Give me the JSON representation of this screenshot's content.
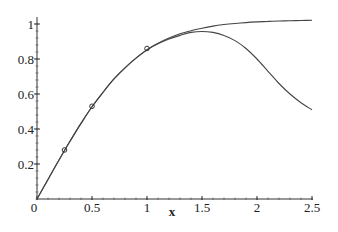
{
  "chart_data": {
    "type": "line",
    "title": "",
    "xlabel": "x",
    "ylabel": "",
    "xlim": [
      0,
      2.5
    ],
    "ylim": [
      0,
      1
    ],
    "grid": false,
    "legend": null,
    "x_ticks": [
      {
        "value": 0,
        "label": "0"
      },
      {
        "value": 0.5,
        "label": "0.5"
      },
      {
        "value": 1,
        "label": "1"
      },
      {
        "value": 1.5,
        "label": "1.5"
      },
      {
        "value": 2,
        "label": "2"
      },
      {
        "value": 2.5,
        "label": "2.5"
      }
    ],
    "y_ticks": [
      {
        "value": 0.2,
        "label": "0.2"
      },
      {
        "value": 0.4,
        "label": "0.4"
      },
      {
        "value": 0.6,
        "label": "0.6"
      },
      {
        "value": 0.8,
        "label": "0.8"
      },
      {
        "value": 1,
        "label": "1"
      }
    ],
    "series": [
      {
        "name": "upper-curve",
        "style": "line",
        "x": [
          0,
          0.1,
          0.2,
          0.3,
          0.4,
          0.5,
          0.6,
          0.7,
          0.8,
          0.9,
          1.0,
          1.1,
          1.2,
          1.3,
          1.4,
          1.5,
          1.6,
          1.7,
          1.8,
          1.9,
          2.0,
          2.1,
          2.2,
          2.3,
          2.4,
          2.5
        ],
        "values": [
          0,
          0.112,
          0.223,
          0.33,
          0.432,
          0.527,
          0.61,
          0.686,
          0.75,
          0.805,
          0.853,
          0.89,
          0.92,
          0.944,
          0.962,
          0.976,
          0.988,
          0.997,
          1.003,
          1.008,
          1.012,
          1.015,
          1.017,
          1.019,
          1.02,
          1.021
        ]
      },
      {
        "name": "lower-curve",
        "style": "line",
        "x": [
          0,
          0.1,
          0.2,
          0.3,
          0.4,
          0.5,
          0.6,
          0.7,
          0.8,
          0.9,
          1.0,
          1.1,
          1.2,
          1.3,
          1.4,
          1.5,
          1.6,
          1.7,
          1.8,
          1.9,
          2.0,
          2.1,
          2.2,
          2.3,
          2.4,
          2.5
        ],
        "values": [
          0,
          0.112,
          0.223,
          0.33,
          0.432,
          0.527,
          0.61,
          0.686,
          0.75,
          0.805,
          0.852,
          0.887,
          0.914,
          0.935,
          0.952,
          0.957,
          0.952,
          0.935,
          0.905,
          0.86,
          0.8,
          0.73,
          0.66,
          0.6,
          0.55,
          0.51
        ]
      },
      {
        "name": "data-points",
        "style": "markers",
        "marker": "circle",
        "x": [
          0.25,
          0.5,
          1.0
        ],
        "values": [
          0.28,
          0.53,
          0.86
        ]
      }
    ]
  }
}
